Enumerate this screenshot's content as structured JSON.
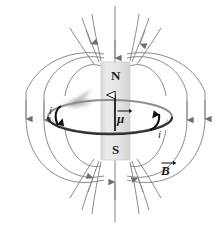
{
  "figure": {
    "background_color": "#ffffff",
    "width": 220,
    "height": 228
  },
  "colors": {
    "field_line": "#8a8a8a",
    "field_arrow": "#6e6e6e",
    "magnet_body": "#e2e2e2",
    "magnet_edge": "#c9c9c9",
    "loop_wire": "#3a3a3a",
    "loop_wire_light": "#9a9a9a",
    "label_text": "#1a1a1a",
    "axis_line": "#9a9a9a",
    "blur_patch": "#b4b4b4"
  },
  "magnet": {
    "name": "bar-magnet",
    "north_label": "N",
    "south_label": "S",
    "x": 101,
    "y": 62,
    "width": 29,
    "height": 98
  },
  "vectors": {
    "mu": {
      "symbol": "μ",
      "description": "magnetic-dipole-moment",
      "direction": "up",
      "tail_y": 130,
      "head_y": 88,
      "x": 115
    },
    "B": {
      "symbol": "B",
      "description": "magnetic-field",
      "x": 163,
      "y": 166
    }
  },
  "current": {
    "symbol": "i",
    "description": "loop-current",
    "sense": "counterclockwise-viewed-from-above",
    "left_label": {
      "x": 49,
      "y": 110
    },
    "right_label": {
      "x": 158,
      "y": 130
    }
  },
  "loop": {
    "name": "current-loop",
    "cx": 110,
    "cy": 117,
    "rx": 62,
    "ry": 17
  },
  "field_lines": {
    "description": "dipole-field-lines",
    "count": 10,
    "arrow_direction_outer": "downward",
    "arrow_direction_top": "inward-to-north-pole",
    "arrow_direction_bottom": "inward-to-south-pole"
  },
  "labels": {
    "north": "N",
    "south": "S",
    "current_left": "i",
    "current_right": "i",
    "mu": "μ",
    "b_field": "B"
  }
}
